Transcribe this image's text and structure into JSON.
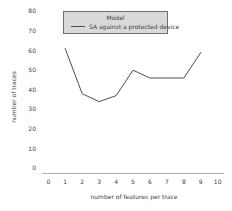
{
  "chart_data": {
    "type": "line",
    "title": "",
    "xlabel": "number of features per trace",
    "ylabel": "number of traces",
    "legend_title": "Model",
    "legend_position": "upper center",
    "legend_bg": "#d9d9d9",
    "grid": false,
    "xlim": [
      0,
      10
    ],
    "ylim": [
      0,
      80
    ],
    "xticks": [
      0,
      1,
      2,
      3,
      4,
      5,
      6,
      7,
      8,
      9,
      10
    ],
    "yticks": [
      0,
      10,
      20,
      30,
      40,
      50,
      60,
      70,
      80
    ],
    "series": [
      {
        "name": "SA against a protected device",
        "color": "#4d4d4d",
        "x": [
          1,
          2,
          3,
          4,
          5,
          6,
          7,
          8,
          9
        ],
        "y": [
          61,
          38,
          34,
          37,
          50,
          46,
          46,
          46,
          59
        ]
      }
    ]
  }
}
